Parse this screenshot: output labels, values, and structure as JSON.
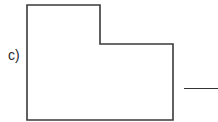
{
  "question": {
    "label": "c)"
  },
  "shape": {
    "type": "L-shaped rectilinear polygon",
    "stroke_color": "#3a3a3a",
    "points": [
      [
        27,
        5
      ],
      [
        100,
        5
      ],
      [
        100,
        44
      ],
      [
        173,
        44
      ],
      [
        173,
        120
      ],
      [
        27,
        120
      ]
    ]
  },
  "answer": {
    "value": ""
  }
}
